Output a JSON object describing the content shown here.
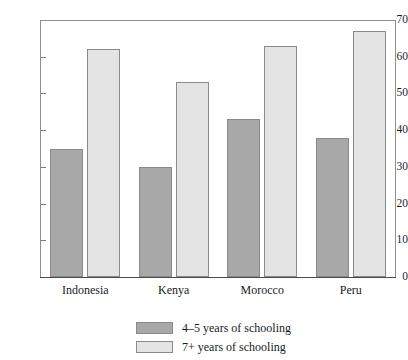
{
  "chart_data": {
    "type": "bar",
    "title": "",
    "title_cropped": true,
    "xlabel": "",
    "ylabel": "",
    "ylim": [
      0,
      70
    ],
    "ytick_step": 10,
    "yticks": [
      0,
      10,
      20,
      30,
      40,
      50,
      60,
      70
    ],
    "grid": false,
    "legend_position": "bottom-center",
    "categories": [
      "Indonesia",
      "Kenya",
      "Morocco",
      "Peru"
    ],
    "series": [
      {
        "name": "4–5 years of schooling",
        "color": "#a8a8a8",
        "values": [
          35,
          30,
          43,
          38
        ]
      },
      {
        "name": "7+ years of schooling",
        "color": "#e4e4e4",
        "values": [
          62,
          53,
          63,
          67
        ]
      }
    ]
  },
  "axis": {
    "tick_labels": [
      "70",
      "60",
      "50",
      "40",
      "30",
      "20",
      "10",
      "0"
    ]
  },
  "legend": {
    "entries": [
      {
        "label": "4–5 years of schooling"
      },
      {
        "label": "7+ years of schooling"
      }
    ]
  }
}
